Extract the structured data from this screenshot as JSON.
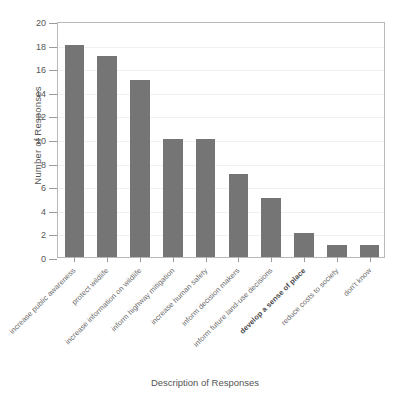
{
  "chart_data": {
    "type": "bar",
    "title": "",
    "xlabel": "Description of Responses",
    "ylabel": "Number of Responses",
    "ylim": [
      0,
      20
    ],
    "ytick_step": 2,
    "grid": true,
    "legend": "none",
    "bar_color": "#757575",
    "frame_color": "#b9b9b9",
    "categories": [
      "increase public awareness",
      "protect wildlife",
      "increase information on wildlife",
      "inform highway mitigation",
      "increase human safety",
      "inform decision makers",
      "inform future land-use decisions",
      "develop a sense of place",
      "reduce costs to society",
      "don't know"
    ],
    "category_emphasis": [
      false,
      false,
      false,
      false,
      false,
      false,
      false,
      true,
      false,
      false
    ],
    "values": [
      18,
      17,
      15,
      10,
      10,
      7,
      5,
      2,
      1,
      1
    ],
    "ytick_labels": [
      "0",
      "2",
      "4",
      "6",
      "8",
      "10",
      "12",
      "14",
      "16",
      "18",
      "20"
    ],
    "ytick_values": [
      0,
      2,
      4,
      6,
      8,
      10,
      12,
      14,
      16,
      18,
      20
    ]
  }
}
